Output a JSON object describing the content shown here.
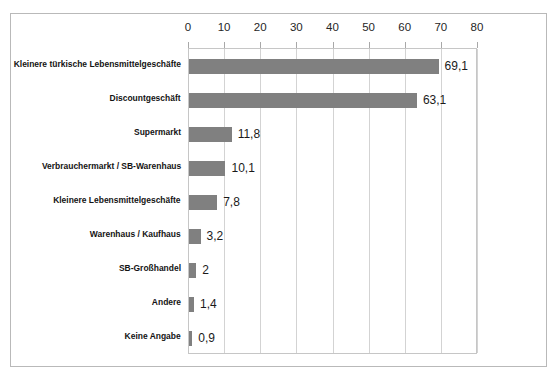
{
  "chart_data": {
    "type": "bar",
    "orientation": "horizontal",
    "title": "",
    "subtitle": "",
    "xlabel": "",
    "ylabel": "",
    "xlim": [
      0,
      80
    ],
    "xticks": [
      0,
      10,
      20,
      30,
      40,
      50,
      60,
      70,
      80
    ],
    "xtick_labels": [
      "0",
      "10",
      "20",
      "30",
      "40",
      "50",
      "60",
      "70",
      "80"
    ],
    "grid": true,
    "legend": null,
    "series_color": "#808080",
    "categories": [
      "Kleinere türkische Lebensmittelgeschäfte",
      "Discountgeschäft",
      "Supermarkt",
      "Verbrauchermarkt / SB-Warenhaus",
      "Kleinere Lebensmittelgeschäfte",
      "Warenhaus / Kaufhaus",
      "SB-Großhandel",
      "Andere",
      "Keine Angabe"
    ],
    "values": [
      69.1,
      63.1,
      11.8,
      10.1,
      7.8,
      3.2,
      2,
      1.4,
      0.9
    ],
    "value_labels": [
      "69,1",
      "63,1",
      "11,8",
      "10,1",
      "7,8",
      "3,2",
      "2",
      "1,4",
      "0,9"
    ]
  },
  "colors": {
    "bar": "#808080",
    "frame_border": "#b9b9b9",
    "plot_border": "#c6c6c6",
    "gridline": "#d3d3d3",
    "text": "#1a1a1a",
    "background": "#ffffff"
  }
}
